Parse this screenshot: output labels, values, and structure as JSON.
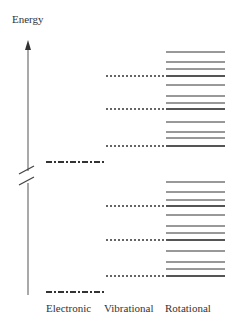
{
  "title": "Energy",
  "axis": {
    "label": "Energy",
    "has_break": true
  },
  "columns": [
    {
      "label": "Electronic"
    },
    {
      "label": "Vibrational"
    },
    {
      "label": "Rotational"
    }
  ],
  "levels": {
    "electronic": [
      {
        "name": "upper-electronic",
        "y": 162
      },
      {
        "name": "lower-electronic",
        "y": 292
      }
    ],
    "upper_manifold": {
      "vibrational": [
        76,
        109,
        146
      ],
      "rotational": [
        52,
        62,
        69,
        76,
        85,
        96,
        103,
        109,
        122,
        132,
        138,
        146
      ]
    },
    "lower_manifold": {
      "vibrational": [
        206,
        240,
        276
      ],
      "rotational": [
        182,
        192,
        200,
        206,
        215,
        226,
        233,
        240,
        251,
        262,
        269,
        276
      ]
    }
  },
  "colors": {
    "line": "#333333",
    "axis": "#555555",
    "text": "#333333"
  }
}
